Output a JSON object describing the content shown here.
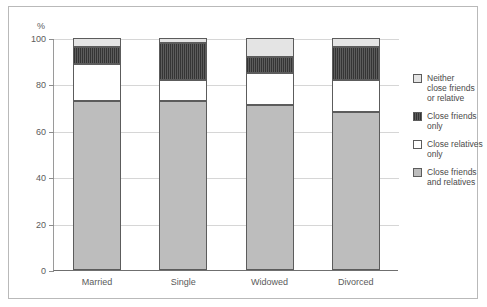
{
  "chart_data": {
    "type": "bar",
    "subtype": "stacked-bar-100",
    "title": "",
    "xlabel": "",
    "ylabel": "%",
    "ylim": [
      0,
      100
    ],
    "yticks": [
      0,
      20,
      40,
      60,
      80,
      100
    ],
    "ytick_labels": [
      "0",
      "20",
      "40",
      "60",
      "80",
      "100"
    ],
    "grid": true,
    "legend_position": "right",
    "categories": [
      "Married",
      "Single",
      "Widowed",
      "Divorced"
    ],
    "series": [
      {
        "name": "Close friends and relatives",
        "color": "#bdbdbd",
        "values": [
          73,
          73,
          71,
          68
        ]
      },
      {
        "name": "Close relatives only",
        "color": "#ffffff",
        "values": [
          16,
          9,
          14,
          14
        ]
      },
      {
        "name": "Close friends only",
        "color": "#4a4a4a",
        "values": [
          7,
          16,
          7,
          14
        ]
      },
      {
        "name": "Neither close friends or relative",
        "color": "#e4e4e4",
        "values": [
          4,
          2,
          8,
          4
        ]
      }
    ]
  },
  "axis": {
    "y_unit_label": "%",
    "ticks": [
      {
        "label": "100",
        "value": 100
      },
      {
        "label": "80",
        "value": 80
      },
      {
        "label": "60",
        "value": 60
      },
      {
        "label": "40",
        "value": 40
      },
      {
        "label": "20",
        "value": 20
      },
      {
        "label": "0",
        "value": 0
      }
    ]
  },
  "legend": {
    "items": [
      {
        "label": "Neither\nclose friends\nor relative",
        "swatch": "s-light"
      },
      {
        "label": "Close friends\nonly",
        "swatch": "s-dark"
      },
      {
        "label": "Close relatives\nonly",
        "swatch": "s-white"
      },
      {
        "label": "Close friends\nand relatives",
        "swatch": "s-gray"
      }
    ]
  },
  "colors": {
    "frame": "#b9b9b9",
    "grid": "#d6d6d6",
    "axis": "#6f6f6f",
    "text": "#5b5b5b",
    "segment_border": "#5c5c5c"
  }
}
